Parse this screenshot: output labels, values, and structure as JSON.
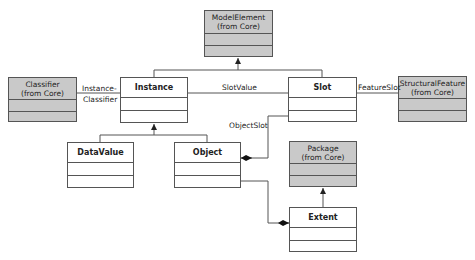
{
  "diagram": {
    "type": "UML class diagram",
    "classes": {
      "model_element": {
        "name": "ModelElement",
        "stereotype": "(from Core)"
      },
      "classifier": {
        "name": "Classifier",
        "stereotype": "(from Core)"
      },
      "instance": {
        "name": "Instance"
      },
      "slot": {
        "name": "Slot"
      },
      "structural_feature": {
        "name": "StructuralFeature",
        "stereotype": "(from Core)"
      },
      "data_value": {
        "name": "DataValue"
      },
      "object": {
        "name": "Object"
      },
      "package": {
        "name": "Package",
        "stereotype": "(from Core)"
      },
      "extent": {
        "name": "Extent"
      }
    },
    "associations": {
      "instance_classifier_1": "Instance-",
      "instance_classifier_2": "Classifier",
      "slot_value": "SlotValue",
      "feature_slot": "FeatureSlot",
      "object_slot": "ObjectSlot"
    },
    "colors": {
      "core_fill": "#c9c9c9",
      "local_fill": "#ffffff",
      "line": "#555555"
    }
  }
}
